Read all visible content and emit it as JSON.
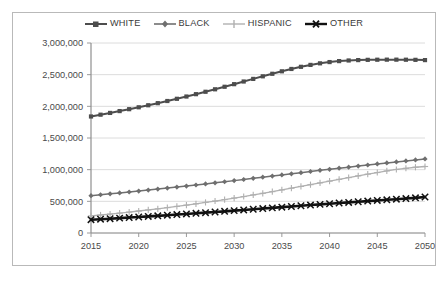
{
  "chart_data": {
    "type": "line",
    "title": "",
    "subtitle": "",
    "xlabel": "",
    "ylabel": "",
    "xlim": [
      2015,
      2050
    ],
    "ylim": [
      0,
      3000000
    ],
    "grid": true,
    "legend_position": "top-center",
    "x_ticks": [
      "2015",
      "2020",
      "2025",
      "2030",
      "2035",
      "2040",
      "2045",
      "2050"
    ],
    "y_ticks": [
      "0",
      "500,000",
      "1,000,000",
      "1,500,000",
      "2,000,000",
      "2,500,000",
      "3,000,000"
    ],
    "x": [
      2015,
      2016,
      2017,
      2018,
      2019,
      2020,
      2021,
      2022,
      2023,
      2024,
      2025,
      2026,
      2027,
      2028,
      2029,
      2030,
      2031,
      2032,
      2033,
      2034,
      2035,
      2036,
      2037,
      2038,
      2039,
      2040,
      2041,
      2042,
      2043,
      2044,
      2045,
      2046,
      2047,
      2048,
      2049,
      2050
    ],
    "series": [
      {
        "name": "WHITE",
        "color": "#4d4d4d",
        "marker": "square",
        "width": 2.0,
        "values": [
          1840000,
          1868000,
          1896000,
          1925000,
          1955000,
          1985000,
          2017000,
          2050000,
          2084000,
          2119000,
          2155000,
          2192000,
          2230000,
          2269000,
          2309000,
          2350000,
          2392000,
          2433000,
          2474000,
          2514000,
          2553000,
          2590000,
          2624000,
          2654000,
          2679000,
          2699000,
          2714000,
          2724000,
          2730000,
          2734000,
          2736000,
          2737000,
          2737000,
          2736000,
          2734000,
          2730000
        ]
      },
      {
        "name": "BLACK",
        "color": "#6f6f6f",
        "marker": "diamond",
        "width": 1.5,
        "values": [
          590000,
          604000,
          618000,
          632000,
          647000,
          662000,
          677000,
          693000,
          709000,
          725000,
          741000,
          758000,
          775000,
          792000,
          809000,
          827000,
          845000,
          863000,
          881000,
          899000,
          917000,
          935000,
          953000,
          971000,
          989000,
          1006000,
          1023000,
          1040000,
          1057000,
          1074000,
          1090000,
          1106000,
          1122000,
          1138000,
          1154000,
          1170000
        ]
      },
      {
        "name": "HISPANIC",
        "color": "#b0b0b0",
        "marker": "plus",
        "width": 1.3,
        "values": [
          270000,
          284000,
          299000,
          314000,
          330000,
          347000,
          364000,
          382000,
          401000,
          420000,
          440000,
          461000,
          483000,
          505000,
          528000,
          552000,
          576000,
          601000,
          627000,
          653000,
          680000,
          707000,
          735000,
          763000,
          791000,
          819000,
          847000,
          875000,
          902000,
          929000,
          955000,
          980000,
          1003000,
          1022000,
          1038000,
          1050000
        ]
      },
      {
        "name": "OTHER",
        "color": "#111111",
        "marker": "x",
        "width": 2.6,
        "values": [
          210000,
          218000,
          226000,
          235000,
          244000,
          253000,
          262000,
          271000,
          281000,
          291000,
          301000,
          311000,
          321000,
          331000,
          342000,
          353000,
          364000,
          375000,
          386000,
          397000,
          408000,
          419000,
          430000,
          441000,
          452000,
          462000,
          473000,
          483000,
          494000,
          504000,
          514000,
          524000,
          534000,
          544000,
          555000,
          568000
        ]
      }
    ]
  },
  "legend": {
    "items": [
      {
        "label": "WHITE"
      },
      {
        "label": "BLACK"
      },
      {
        "label": "HISPANIC"
      },
      {
        "label": "OTHER"
      }
    ]
  },
  "axes": {
    "y_tick_labels": [
      "3,000,000",
      "2,500,000",
      "2,000,000",
      "1,500,000",
      "1,000,000",
      "500,000",
      "0"
    ],
    "x_tick_labels": [
      "2015",
      "2020",
      "2025",
      "2030",
      "2035",
      "2040",
      "2045",
      "2050"
    ]
  }
}
